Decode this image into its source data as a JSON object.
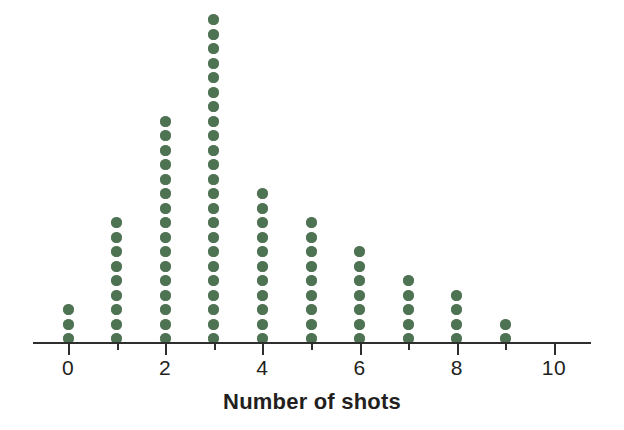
{
  "chart_data": {
    "type": "bar",
    "plot_style": "dot-plot",
    "title": "",
    "xlabel": "Number of shots",
    "ylabel": "",
    "categories": [
      0,
      1,
      2,
      3,
      4,
      5,
      6,
      7,
      8,
      9,
      10
    ],
    "values": [
      3,
      9,
      16,
      23,
      11,
      9,
      7,
      5,
      4,
      2,
      0
    ],
    "tick_labels": [
      "0",
      "",
      "2",
      "",
      "4",
      "",
      "6",
      "",
      "8",
      "",
      "10"
    ],
    "labeled_ticks": [
      "0",
      "2",
      "4",
      "6",
      "8",
      "10"
    ],
    "xlim": [
      -0.5,
      10.6
    ],
    "ylim": [
      0,
      23
    ],
    "grid": false,
    "legend": null,
    "dot_color": "#4e7352",
    "axis_color": "#2e2e2e",
    "text_color": "#231f20",
    "background": "#ffffff",
    "annotations": []
  },
  "axis": {
    "title": "Number of shots",
    "ticks": [
      {
        "value": "0",
        "label": "0",
        "major": true
      },
      {
        "value": "1",
        "label": "",
        "major": false
      },
      {
        "value": "2",
        "label": "2",
        "major": true
      },
      {
        "value": "3",
        "label": "",
        "major": false
      },
      {
        "value": "4",
        "label": "4",
        "major": true
      },
      {
        "value": "5",
        "label": "",
        "major": false
      },
      {
        "value": "6",
        "label": "6",
        "major": true
      },
      {
        "value": "7",
        "label": "",
        "major": false
      },
      {
        "value": "8",
        "label": "8",
        "major": true
      },
      {
        "value": "9",
        "label": "",
        "major": false
      },
      {
        "value": "10",
        "label": "10",
        "major": true
      }
    ]
  }
}
